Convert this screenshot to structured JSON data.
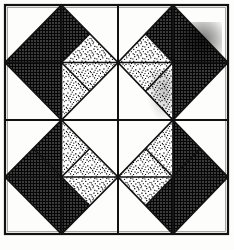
{
  "figure": {
    "type": "line-drawing",
    "canvas": {
      "width": 234,
      "height": 250
    },
    "background_color": "#fdfdfb",
    "ink_color": "#111111"
  },
  "frame": {
    "label": "Outer frame border",
    "x": 5,
    "y": 5,
    "width": 223,
    "height": 229,
    "stroke_color": "#121212",
    "stroke_width": 2.2,
    "fill_color": "#fdfdfb"
  },
  "grid": {
    "label": "Block division grid",
    "rows": 2,
    "columns": 2,
    "vertical_divider_x": 118,
    "horizontal_divider_y": 120,
    "stroke_color": "#121212",
    "stroke_width": 2.0
  },
  "textures": {
    "dark": {
      "name": "dark-crosshatch-fill",
      "description": "fine dense crosshatch grid screen, reads near-black",
      "base_color": "#2a2a2a",
      "line_color": "#0a0a0a",
      "cell_size": 3
    },
    "light": {
      "name": "light-stipple-fill",
      "description": "random stipple dots on white ground",
      "base_color": "#ffffff",
      "dot_color": "#1a1a1a",
      "density": "medium"
    },
    "blank": {
      "name": "blank-fill",
      "description": "unfilled paper ground",
      "base_color": "#fdfdfb"
    }
  },
  "blocks": [
    {
      "name": "block-top-left",
      "row": 0,
      "column": 0,
      "x": 5,
      "y": 5,
      "width": 113,
      "height": 115,
      "diamond": {
        "name": "diamond-top-left",
        "description": "square-on-point inscribed, vertices at edge midpoints",
        "wedges": [
          {
            "name": "wedge-n-outer",
            "fill": "dark"
          },
          {
            "name": "wedge-n-inner",
            "fill": "dark"
          },
          {
            "name": "wedge-e-outer",
            "fill": "light"
          },
          {
            "name": "wedge-e-inner",
            "fill": "light"
          },
          {
            "name": "wedge-s-outer",
            "fill": "light"
          },
          {
            "name": "wedge-s-inner",
            "fill": "dark"
          },
          {
            "name": "wedge-w-outer",
            "fill": "dark"
          },
          {
            "name": "wedge-w-inner",
            "fill": "dark"
          }
        ]
      },
      "corners": [
        {
          "name": "corner-nw",
          "fill": "blank"
        },
        {
          "name": "corner-ne",
          "fill": "blank"
        },
        {
          "name": "corner-se",
          "fill": "blank"
        },
        {
          "name": "corner-sw",
          "fill": "blank"
        }
      ]
    },
    {
      "name": "block-top-right",
      "row": 0,
      "column": 1,
      "x": 118,
      "y": 5,
      "width": 110,
      "height": 115,
      "diamond": {
        "name": "diamond-top-right",
        "description": "horizontal mirror of top-left diamond",
        "wedges": [
          {
            "name": "wedge-n-outer",
            "fill": "dark"
          },
          {
            "name": "wedge-n-inner",
            "fill": "dark"
          },
          {
            "name": "wedge-e-outer",
            "fill": "dark"
          },
          {
            "name": "wedge-e-inner",
            "fill": "dark"
          },
          {
            "name": "wedge-s-outer",
            "fill": "light"
          },
          {
            "name": "wedge-s-inner",
            "fill": "dark"
          },
          {
            "name": "wedge-w-outer",
            "fill": "light"
          },
          {
            "name": "wedge-w-inner",
            "fill": "light"
          }
        ]
      },
      "corners": [
        {
          "name": "corner-nw",
          "fill": "blank"
        },
        {
          "name": "corner-ne",
          "fill": "blank"
        },
        {
          "name": "corner-se",
          "fill": "blank"
        },
        {
          "name": "corner-sw",
          "fill": "blank"
        }
      ]
    },
    {
      "name": "block-bottom-left",
      "row": 1,
      "column": 0,
      "x": 5,
      "y": 120,
      "width": 113,
      "height": 114,
      "diamond": {
        "name": "diamond-bottom-left",
        "description": "vertical mirror of top-left diamond",
        "wedges": [
          {
            "name": "wedge-n-outer",
            "fill": "light"
          },
          {
            "name": "wedge-n-inner",
            "fill": "dark"
          },
          {
            "name": "wedge-e-outer",
            "fill": "light"
          },
          {
            "name": "wedge-e-inner",
            "fill": "light"
          },
          {
            "name": "wedge-s-outer",
            "fill": "dark"
          },
          {
            "name": "wedge-s-inner",
            "fill": "dark"
          },
          {
            "name": "wedge-w-outer",
            "fill": "dark"
          },
          {
            "name": "wedge-w-inner",
            "fill": "dark"
          }
        ]
      },
      "corners": [
        {
          "name": "corner-nw",
          "fill": "blank"
        },
        {
          "name": "corner-ne",
          "fill": "blank"
        },
        {
          "name": "corner-se",
          "fill": "blank"
        },
        {
          "name": "corner-sw",
          "fill": "blank"
        }
      ]
    },
    {
      "name": "block-bottom-right",
      "row": 1,
      "column": 1,
      "x": 118,
      "y": 120,
      "width": 110,
      "height": 114,
      "diamond": {
        "name": "diamond-bottom-right",
        "description": "point mirror of top-left diamond",
        "wedges": [
          {
            "name": "wedge-n-outer",
            "fill": "light"
          },
          {
            "name": "wedge-n-inner",
            "fill": "dark"
          },
          {
            "name": "wedge-e-outer",
            "fill": "dark"
          },
          {
            "name": "wedge-e-inner",
            "fill": "dark"
          },
          {
            "name": "wedge-s-outer",
            "fill": "dark"
          },
          {
            "name": "wedge-s-inner",
            "fill": "dark"
          },
          {
            "name": "wedge-w-outer",
            "fill": "light"
          },
          {
            "name": "wedge-w-inner",
            "fill": "light"
          }
        ]
      },
      "corners": [
        {
          "name": "corner-nw",
          "fill": "blank"
        },
        {
          "name": "corner-ne",
          "fill": "blank"
        },
        {
          "name": "corner-se",
          "fill": "blank"
        },
        {
          "name": "corner-sw",
          "fill": "blank"
        }
      ]
    }
  ],
  "artifacts": [
    {
      "name": "scan-smudge-top-right",
      "description": "darker photocopy smudge over top-right diamond north-east wedge",
      "x": 178,
      "y": 22,
      "width": 44,
      "height": 46,
      "opacity": 0.33
    },
    {
      "name": "scan-smudge-center-right",
      "description": "faint darker streak near right of center",
      "x": 148,
      "y": 70,
      "width": 28,
      "height": 50,
      "opacity": 0.18
    }
  ]
}
